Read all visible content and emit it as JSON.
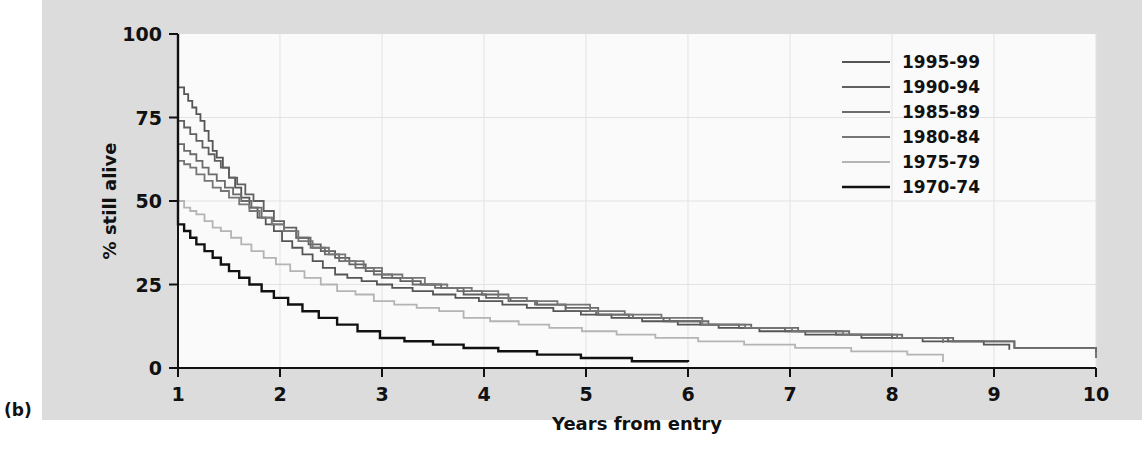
{
  "panel": {
    "label": "(b)"
  },
  "chart_data": {
    "type": "line",
    "title": "",
    "subtitle": "",
    "xlabel": "Years from entry",
    "ylabel": "% still alive",
    "xlim": [
      1,
      10
    ],
    "ylim": [
      0,
      100
    ],
    "xticks": [
      1,
      2,
      3,
      4,
      5,
      6,
      7,
      8,
      9,
      10
    ],
    "xtick_labels": [
      "1",
      "2",
      "3",
      "4",
      "5",
      "6",
      "7",
      "8",
      "9",
      "10"
    ],
    "yticks": [
      0,
      25,
      50,
      75,
      100
    ],
    "ytick_labels": [
      "0",
      "25",
      "50",
      "75",
      "100"
    ],
    "grid": true,
    "grid_color": "#e3e3e3",
    "legend_position": "top-right",
    "step": "post",
    "series": [
      {
        "name": "1995-99",
        "color": "#555555",
        "width": 1.8,
        "points": [
          [
            1.0,
            100
          ],
          [
            1.0,
            84
          ],
          [
            1.06,
            82
          ],
          [
            1.1,
            80
          ],
          [
            1.14,
            78
          ],
          [
            1.18,
            76
          ],
          [
            1.22,
            74
          ],
          [
            1.26,
            71
          ],
          [
            1.3,
            68
          ],
          [
            1.34,
            65
          ],
          [
            1.38,
            63
          ],
          [
            1.44,
            60
          ],
          [
            1.5,
            57
          ],
          [
            1.56,
            54
          ],
          [
            1.62,
            51
          ],
          [
            1.7,
            48
          ],
          [
            1.78,
            45
          ],
          [
            1.86,
            43
          ],
          [
            1.94,
            41
          ],
          [
            2.02,
            38
          ],
          [
            2.12,
            36
          ],
          [
            2.22,
            34
          ],
          [
            2.32,
            32
          ],
          [
            2.42,
            30
          ],
          [
            2.54,
            28
          ],
          [
            2.66,
            27
          ],
          [
            2.8,
            26
          ],
          [
            2.95,
            25
          ],
          [
            3.1,
            24
          ],
          [
            3.3,
            23
          ],
          [
            3.5,
            22
          ],
          [
            3.72,
            21
          ],
          [
            3.95,
            20
          ],
          [
            4.18,
            19
          ],
          [
            4.42,
            18
          ],
          [
            4.68,
            17
          ],
          [
            4.95,
            16
          ],
          [
            5.25,
            15
          ],
          [
            5.55,
            14
          ],
          [
            5.9,
            13
          ],
          [
            6.3,
            12
          ],
          [
            6.7,
            11
          ],
          [
            7.15,
            10
          ],
          [
            7.7,
            9
          ],
          [
            8.3,
            8
          ],
          [
            8.9,
            7
          ],
          [
            9.15,
            6
          ],
          [
            9.15,
            5.5
          ]
        ]
      },
      {
        "name": "1990-94",
        "color": "#606060",
        "width": 1.8,
        "points": [
          [
            1.0,
            100
          ],
          [
            1.0,
            74
          ],
          [
            1.06,
            72
          ],
          [
            1.12,
            70
          ],
          [
            1.18,
            68
          ],
          [
            1.24,
            66
          ],
          [
            1.3,
            64
          ],
          [
            1.36,
            62
          ],
          [
            1.42,
            60
          ],
          [
            1.5,
            57
          ],
          [
            1.58,
            55
          ],
          [
            1.66,
            52
          ],
          [
            1.74,
            50
          ],
          [
            1.84,
            47
          ],
          [
            1.94,
            44
          ],
          [
            2.04,
            42
          ],
          [
            2.16,
            39
          ],
          [
            2.28,
            37
          ],
          [
            2.4,
            35
          ],
          [
            2.54,
            33
          ],
          [
            2.68,
            31
          ],
          [
            2.84,
            29
          ],
          [
            3.0,
            27
          ],
          [
            3.18,
            26
          ],
          [
            3.38,
            25
          ],
          [
            3.58,
            24
          ],
          [
            3.8,
            22
          ],
          [
            4.02,
            21
          ],
          [
            4.26,
            20
          ],
          [
            4.52,
            19
          ],
          [
            4.8,
            17
          ],
          [
            5.1,
            16
          ],
          [
            5.42,
            15
          ],
          [
            5.76,
            14
          ],
          [
            6.12,
            13
          ],
          [
            6.5,
            12
          ],
          [
            6.95,
            11
          ],
          [
            7.45,
            10
          ],
          [
            8.0,
            9
          ],
          [
            8.55,
            8
          ],
          [
            9.2,
            6
          ],
          [
            10.0,
            5
          ],
          [
            10.0,
            4.8
          ]
        ]
      },
      {
        "name": "1985-89",
        "color": "#6b6b6b",
        "width": 1.8,
        "points": [
          [
            1.0,
            100
          ],
          [
            1.0,
            67
          ],
          [
            1.06,
            65
          ],
          [
            1.12,
            64
          ],
          [
            1.18,
            62
          ],
          [
            1.24,
            60
          ],
          [
            1.3,
            58
          ],
          [
            1.38,
            56
          ],
          [
            1.46,
            54
          ],
          [
            1.54,
            52
          ],
          [
            1.62,
            50
          ],
          [
            1.72,
            48
          ],
          [
            1.82,
            45
          ],
          [
            1.92,
            43
          ],
          [
            2.04,
            41
          ],
          [
            2.16,
            39
          ],
          [
            2.3,
            36
          ],
          [
            2.44,
            34
          ],
          [
            2.58,
            32
          ],
          [
            2.74,
            30
          ],
          [
            2.92,
            28
          ],
          [
            3.1,
            27
          ],
          [
            3.3,
            25
          ],
          [
            3.52,
            24
          ],
          [
            3.74,
            23
          ],
          [
            3.98,
            22
          ],
          [
            4.24,
            20
          ],
          [
            4.5,
            19
          ],
          [
            4.8,
            18
          ],
          [
            5.12,
            16
          ],
          [
            5.46,
            15
          ],
          [
            5.82,
            14
          ],
          [
            6.2,
            13
          ],
          [
            6.62,
            12
          ],
          [
            7.08,
            11
          ],
          [
            7.58,
            10
          ],
          [
            8.1,
            9
          ],
          [
            8.6,
            8
          ],
          [
            9.2,
            6
          ],
          [
            10.0,
            3.2
          ],
          [
            10.0,
            3.0
          ]
        ]
      },
      {
        "name": "1980-84",
        "color": "#767676",
        "width": 1.8,
        "points": [
          [
            1.0,
            100
          ],
          [
            1.0,
            62
          ],
          [
            1.06,
            61
          ],
          [
            1.12,
            60
          ],
          [
            1.18,
            58
          ],
          [
            1.26,
            56
          ],
          [
            1.34,
            54
          ],
          [
            1.42,
            53
          ],
          [
            1.5,
            51
          ],
          [
            1.6,
            49
          ],
          [
            1.7,
            47
          ],
          [
            1.8,
            45
          ],
          [
            1.92,
            43
          ],
          [
            2.04,
            41
          ],
          [
            2.18,
            38
          ],
          [
            2.32,
            36
          ],
          [
            2.48,
            34
          ],
          [
            2.64,
            32
          ],
          [
            2.82,
            30
          ],
          [
            3.0,
            28
          ],
          [
            3.2,
            27
          ],
          [
            3.42,
            25
          ],
          [
            3.64,
            24
          ],
          [
            3.88,
            23
          ],
          [
            4.14,
            21
          ],
          [
            4.42,
            20
          ],
          [
            4.72,
            19
          ],
          [
            5.04,
            17
          ],
          [
            5.38,
            16
          ],
          [
            5.74,
            15
          ],
          [
            6.14,
            13
          ],
          [
            6.56,
            12
          ],
          [
            7.02,
            11
          ],
          [
            7.52,
            10
          ],
          [
            8.05,
            9
          ],
          [
            8.5,
            8
          ],
          [
            8.5,
            7.5
          ]
        ]
      },
      {
        "name": "1975-79",
        "color": "#b4b4b4",
        "width": 1.8,
        "points": [
          [
            1.0,
            100
          ],
          [
            1.0,
            50
          ],
          [
            1.06,
            48
          ],
          [
            1.12,
            47
          ],
          [
            1.18,
            46
          ],
          [
            1.26,
            44
          ],
          [
            1.34,
            42
          ],
          [
            1.42,
            41
          ],
          [
            1.52,
            39
          ],
          [
            1.62,
            37
          ],
          [
            1.72,
            35
          ],
          [
            1.84,
            33
          ],
          [
            1.96,
            31
          ],
          [
            2.1,
            29
          ],
          [
            2.24,
            27
          ],
          [
            2.4,
            25
          ],
          [
            2.56,
            23
          ],
          [
            2.74,
            22
          ],
          [
            2.92,
            20
          ],
          [
            3.12,
            19
          ],
          [
            3.34,
            18
          ],
          [
            3.56,
            17
          ],
          [
            3.8,
            15
          ],
          [
            4.06,
            14
          ],
          [
            4.34,
            13
          ],
          [
            4.64,
            12
          ],
          [
            4.96,
            11
          ],
          [
            5.3,
            10
          ],
          [
            5.68,
            9
          ],
          [
            6.1,
            8
          ],
          [
            6.55,
            7
          ],
          [
            7.05,
            6
          ],
          [
            7.6,
            5
          ],
          [
            8.15,
            4
          ],
          [
            8.5,
            2
          ],
          [
            8.5,
            1.8
          ]
        ]
      },
      {
        "name": "1970-74",
        "color": "#111111",
        "width": 2.4,
        "points": [
          [
            1.0,
            100
          ],
          [
            1.0,
            43
          ],
          [
            1.06,
            41
          ],
          [
            1.12,
            39
          ],
          [
            1.18,
            37
          ],
          [
            1.26,
            35
          ],
          [
            1.34,
            33
          ],
          [
            1.42,
            31
          ],
          [
            1.5,
            29
          ],
          [
            1.6,
            27
          ],
          [
            1.7,
            25
          ],
          [
            1.82,
            23
          ],
          [
            1.94,
            21
          ],
          [
            2.08,
            19
          ],
          [
            2.22,
            17
          ],
          [
            2.38,
            15
          ],
          [
            2.56,
            13
          ],
          [
            2.76,
            11
          ],
          [
            2.98,
            9
          ],
          [
            3.22,
            8
          ],
          [
            3.5,
            7
          ],
          [
            3.8,
            6
          ],
          [
            4.14,
            5
          ],
          [
            4.52,
            4
          ],
          [
            4.95,
            3
          ],
          [
            5.45,
            2
          ],
          [
            6.0,
            2
          ],
          [
            6.0,
            1.8
          ]
        ]
      }
    ]
  },
  "legend": {
    "entries": [
      {
        "label": "1995-99",
        "color": "#555555"
      },
      {
        "label": "1990-94",
        "color": "#606060"
      },
      {
        "label": "1985-89",
        "color": "#6b6b6b"
      },
      {
        "label": "1980-84",
        "color": "#767676"
      },
      {
        "label": "1975-79",
        "color": "#b4b4b4"
      },
      {
        "label": "1970-74",
        "color": "#111111"
      }
    ]
  }
}
